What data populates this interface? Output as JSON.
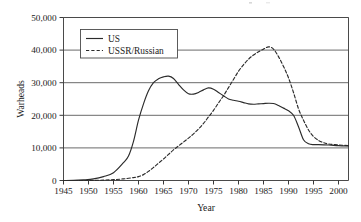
{
  "chart_data": {
    "type": "line",
    "title": "",
    "xlabel": "Year",
    "ylabel": "Warheads",
    "xlim": [
      1945,
      2002
    ],
    "ylim": [
      0,
      50000
    ],
    "grid": true,
    "legend_position": "top-left-inside",
    "xticks": [
      1945,
      1950,
      1955,
      1960,
      1965,
      1970,
      1975,
      1980,
      1985,
      1990,
      1995,
      2000
    ],
    "xtick_labels": [
      "1945",
      "1950",
      "1955",
      "1960",
      "1965",
      "1970",
      "1975",
      "1980",
      "1985",
      "1990",
      "1995",
      "2000"
    ],
    "yticks": [
      0,
      10000,
      20000,
      30000,
      40000,
      50000
    ],
    "ytick_labels": [
      "0",
      "10,000",
      "20,000",
      "30,000",
      "40,000",
      "50,000"
    ],
    "series": [
      {
        "name": "US",
        "style": "solid",
        "color": "#2b2b2b",
        "x": [
          1945,
          1947,
          1949,
          1951,
          1953,
          1955,
          1957,
          1958,
          1959,
          1960,
          1961,
          1962,
          1963,
          1964,
          1965,
          1966,
          1967,
          1968,
          1969,
          1970,
          1971,
          1972,
          1973,
          1974,
          1975,
          1976,
          1977,
          1978,
          1979,
          1980,
          1981,
          1982,
          1983,
          1984,
          1985,
          1986,
          1987,
          1988,
          1989,
          1990,
          1991,
          1992,
          1993,
          1994,
          1995,
          1996,
          1998,
          2000,
          2002
        ],
        "y": [
          6,
          30,
          200,
          500,
          1200,
          2400,
          5500,
          7500,
          12000,
          18500,
          23500,
          27500,
          30000,
          31200,
          31800,
          32000,
          31300,
          29500,
          27800,
          26600,
          26500,
          27000,
          27800,
          28400,
          28000,
          27000,
          26000,
          25000,
          24600,
          24300,
          23900,
          23500,
          23400,
          23500,
          23600,
          23700,
          23600,
          23000,
          22200,
          21400,
          20000,
          16500,
          12500,
          11300,
          11000,
          11000,
          10900,
          10700,
          10600
        ]
      },
      {
        "name": "USSR/Russian",
        "style": "dashed",
        "color": "#2b2b2b",
        "x": [
          1945,
          1949,
          1951,
          1953,
          1955,
          1957,
          1959,
          1960,
          1961,
          1962,
          1963,
          1964,
          1965,
          1966,
          1967,
          1968,
          1969,
          1970,
          1971,
          1972,
          1973,
          1974,
          1975,
          1976,
          1977,
          1978,
          1979,
          1980,
          1981,
          1982,
          1983,
          1984,
          1985,
          1986,
          1987,
          1988,
          1989,
          1990,
          1991,
          1992,
          1993,
          1994,
          1995,
          1996,
          1997,
          1998,
          2000,
          2002
        ],
        "y": [
          0,
          5,
          30,
          120,
          250,
          500,
          900,
          1200,
          1800,
          2800,
          4000,
          5300,
          6600,
          8000,
          9400,
          10600,
          11800,
          13000,
          14300,
          15800,
          17500,
          19500,
          21500,
          23800,
          26000,
          28500,
          31000,
          33500,
          35500,
          37200,
          38500,
          39500,
          40300,
          41000,
          40300,
          38000,
          35000,
          31500,
          27000,
          22000,
          18500,
          15500,
          13500,
          12300,
          11600,
          11200,
          10900,
          10700
        ]
      }
    ]
  },
  "legend": {
    "items": [
      {
        "label": "US",
        "style": "solid"
      },
      {
        "label": "USSR/Russian",
        "style": "dashed"
      }
    ]
  }
}
